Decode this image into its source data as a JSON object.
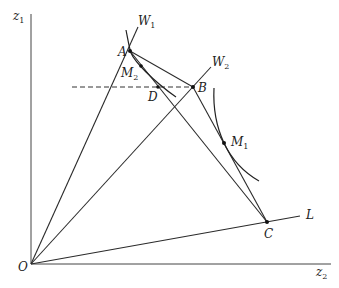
{
  "diagram": {
    "axes": {
      "vertical_label": "z",
      "vertical_sub": "1",
      "horizontal_label": "z",
      "horizontal_sub": "2",
      "origin_label": "O"
    },
    "rays": [
      {
        "label": "W",
        "sub": "1"
      },
      {
        "label": "W",
        "sub": "2"
      },
      {
        "label": "L",
        "sub": ""
      }
    ],
    "points": {
      "A": "A",
      "B": "B",
      "C": "C",
      "D": "D",
      "M1": {
        "label": "M",
        "sub": "1"
      },
      "M2": {
        "label": "M",
        "sub": "2"
      }
    }
  }
}
